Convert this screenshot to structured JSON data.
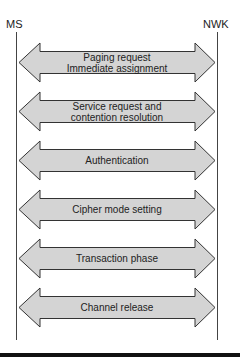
{
  "endpoints": {
    "left": "MS",
    "right": "NWK"
  },
  "colors": {
    "arrow_fill": "#d4d4d4",
    "arrow_stroke": "#333333",
    "lifeline": "#444444"
  },
  "arrows": [
    {
      "lines": [
        "Paging request",
        "Immediate assignment"
      ]
    },
    {
      "lines": [
        "Service request and",
        "contention resolution"
      ]
    },
    {
      "lines": [
        "Authentication"
      ]
    },
    {
      "lines": [
        "Cipher mode setting"
      ]
    },
    {
      "lines": [
        "Transaction phase"
      ]
    },
    {
      "lines": [
        "Channel release"
      ]
    }
  ]
}
